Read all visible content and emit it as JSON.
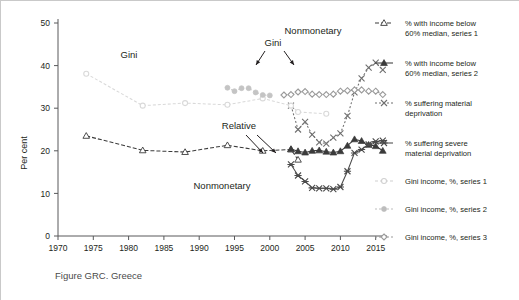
{
  "figure": {
    "caption": "Figure GRC. Greece",
    "ylabel": "Per cent"
  },
  "annotations": [
    {
      "name": "gini-left",
      "text": "Gini",
      "x": 128,
      "y": 57
    },
    {
      "name": "gini-right",
      "text": "Gini",
      "x": 272,
      "y": 45
    },
    {
      "name": "relative",
      "text": "Relative",
      "x": 238,
      "y": 128
    },
    {
      "name": "nonmonetary-low",
      "text": "Nonmonetary",
      "x": 221,
      "y": 188
    },
    {
      "name": "nonmonetary-high",
      "text": "Nonmonetary",
      "x": 312,
      "y": 33
    }
  ],
  "legend": {
    "items": [
      {
        "key": "income60_s1",
        "label": "% with income below\n60% median, series 1",
        "marker": "open-triangle",
        "color": "#3b3b3b",
        "dash": "4,2"
      },
      {
        "key": "income60_s2",
        "label": "% with income below\n60% median, series 2",
        "marker": "filled-triangle",
        "color": "#3b3b3b",
        "dash": "0"
      },
      {
        "key": "matdep",
        "label": "% suffering material\ndeprivation",
        "marker": "x",
        "color": "#6f6f6f",
        "dash": "2,2"
      },
      {
        "key": "sevmatdep",
        "label": "% suffering severe\nmaterial deprivation",
        "marker": "x-bar",
        "color": "#4a4a4a",
        "dash": "0"
      },
      {
        "key": "gini_s1",
        "label": "Gini income, %, series 1",
        "marker": "circle-open",
        "color": "#d0d0d0",
        "dash": "3,2"
      },
      {
        "key": "gini_s2",
        "label": "Gini income, %, series 2",
        "marker": "circle-filled",
        "color": "#bdbdbd",
        "dash": "2,2"
      },
      {
        "key": "gini_s3",
        "label": "Gini income, %, series 3",
        "marker": "diamond",
        "color": "#9a9a9a",
        "dash": "2,2"
      }
    ]
  },
  "chart_data": {
    "type": "line",
    "title": "Figure GRC. Greece",
    "xlabel": "",
    "ylabel": "Per cent",
    "xlim": [
      1970,
      2017
    ],
    "ylim": [
      0,
      50
    ],
    "xticks": [
      1970,
      1975,
      1980,
      1985,
      1990,
      1995,
      2000,
      2005,
      2010,
      2015
    ],
    "yticks": [
      0,
      10,
      20,
      30,
      40,
      50
    ],
    "grid": false,
    "legend_position": "right",
    "series": [
      {
        "name": "% with income below 60% median, series 1",
        "marker": "open-triangle",
        "color": "#3b3b3b",
        "dash": "4,2",
        "x": [
          1974,
          1982,
          1988,
          1994,
          1999,
          2003,
          2004
        ],
        "y": [
          23.5,
          20.1,
          19.7,
          21.3,
          20.0,
          20.3,
          17.9
        ]
      },
      {
        "name": "% with income below 60% median, series 2",
        "marker": "filled-triangle",
        "color": "#3b3b3b",
        "dash": "0",
        "x": [
          2003,
          2004,
          2005,
          2006,
          2007,
          2008,
          2009,
          2010,
          2011,
          2012,
          2013,
          2014,
          2015,
          2016
        ],
        "y": [
          20.4,
          19.9,
          19.6,
          20.0,
          20.1,
          19.8,
          19.6,
          19.9,
          21.2,
          22.7,
          22.3,
          21.4,
          21.1,
          20.0
        ]
      },
      {
        "name": "% suffering material deprivation",
        "marker": "x",
        "color": "#6f6f6f",
        "dash": "2,2",
        "x": [
          2003,
          2004,
          2005,
          2006,
          2007,
          2008,
          2009,
          2010,
          2011,
          2012,
          2013,
          2014,
          2015,
          2016
        ],
        "y": [
          30.6,
          25.0,
          26.8,
          23.8,
          22.0,
          21.7,
          23.1,
          24.1,
          28.2,
          33.7,
          37.0,
          39.5,
          40.7,
          39.0
        ]
      },
      {
        "name": "% suffering severe material deprivation",
        "marker": "x-bar",
        "color": "#4a4a4a",
        "dash": "0",
        "x": [
          2003,
          2004,
          2005,
          2006,
          2007,
          2008,
          2009,
          2010,
          2011,
          2012,
          2013,
          2014,
          2015,
          2016
        ],
        "y": [
          16.8,
          14.2,
          12.8,
          11.3,
          11.2,
          11.2,
          11.0,
          11.5,
          15.2,
          19.5,
          20.3,
          21.5,
          22.2,
          22.4
        ]
      },
      {
        "name": "Gini income, %, series 1",
        "marker": "circle-open",
        "color": "#d9d9d9",
        "dash": "3,2",
        "x": [
          1974,
          1982,
          1988,
          1994,
          1999,
          2003,
          2004,
          2008
        ],
        "y": [
          38.1,
          30.6,
          31.2,
          30.8,
          32.3,
          30.6,
          29.1,
          28.7
        ]
      },
      {
        "name": "Gini income, %, series 2",
        "marker": "circle-filled",
        "color": "#c4c4c4",
        "dash": "2,2",
        "x": [
          1994,
          1995,
          1996,
          1997,
          1998,
          1999,
          2000
        ],
        "y": [
          34.8,
          34.0,
          34.7,
          34.7,
          33.7,
          33.1,
          33.0
        ]
      },
      {
        "name": "Gini income, %, series 3",
        "marker": "diamond",
        "color": "#9a9a9a",
        "dash": "2,2",
        "x": [
          2002,
          2003,
          2004,
          2005,
          2006,
          2007,
          2008,
          2009,
          2010,
          2011,
          2012,
          2013,
          2014,
          2015,
          2016
        ],
        "y": [
          33.1,
          33.2,
          33.8,
          33.9,
          33.3,
          33.2,
          33.2,
          33.3,
          34.0,
          34.1,
          34.3,
          34.3,
          34.0,
          34.0,
          33.2
        ]
      }
    ]
  }
}
